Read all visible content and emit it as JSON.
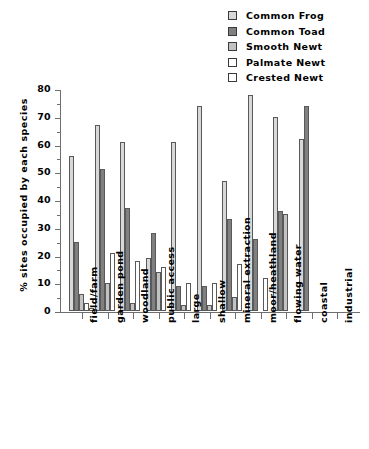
{
  "chart_data": {
    "type": "bar",
    "title": "",
    "xlabel": "",
    "ylabel": "% sites occupied by each species",
    "ylim": [
      0,
      80
    ],
    "yticks": [
      0,
      10,
      20,
      30,
      40,
      50,
      60,
      70,
      80
    ],
    "grid": false,
    "legend_position": "top-right",
    "categories": [
      "field/farm",
      "garden pond",
      "woodland",
      "public access",
      "large",
      "shallow",
      "mineral extraction",
      "moor/heathland",
      "flowing water",
      "coastal",
      "industrial"
    ],
    "series": [
      {
        "name": "Common Frog",
        "color": "#d8d8d8",
        "values": [
          56,
          67,
          61,
          19,
          61,
          74,
          47,
          78,
          70,
          62,
          0
        ]
      },
      {
        "name": "Common Toad",
        "color": "#808080",
        "values": [
          25,
          51,
          37,
          28,
          9,
          9,
          33,
          26,
          36,
          74,
          0
        ]
      },
      {
        "name": "Smooth Newt",
        "color": "#c2c2c2",
        "values": [
          6,
          10,
          3,
          14,
          2,
          2,
          5,
          0,
          35,
          0,
          0
        ]
      },
      {
        "name": "Palmate Newt",
        "color": "#ffffff",
        "values": [
          3,
          21,
          18,
          16,
          10,
          10,
          17,
          12,
          0,
          0,
          0
        ]
      },
      {
        "name": "Crested Newt",
        "color": "#ffffff",
        "values": [
          1,
          0,
          0,
          0,
          0,
          0,
          0,
          0,
          0,
          0,
          0
        ]
      }
    ]
  },
  "legend": {
    "items": [
      {
        "label": "Common Frog"
      },
      {
        "label": "Common Toad"
      },
      {
        "label": "Smooth Newt"
      },
      {
        "label": "Palmate Newt"
      },
      {
        "label": "Crested Newt"
      }
    ]
  }
}
